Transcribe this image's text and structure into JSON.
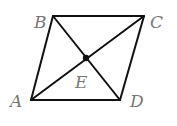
{
  "diagram": {
    "type": "parallelogram-with-diagonals",
    "colors": {
      "line": "#111111",
      "label": "#777777",
      "background": "#ffffff"
    },
    "vertices": [
      {
        "id": "A",
        "label": "A",
        "x": 31,
        "y": 100,
        "label_x": 10,
        "label_y": 107
      },
      {
        "id": "B",
        "label": "B",
        "x": 53,
        "y": 16,
        "label_x": 34,
        "label_y": 28
      },
      {
        "id": "C",
        "label": "C",
        "x": 144,
        "y": 16,
        "label_x": 150,
        "label_y": 28
      },
      {
        "id": "D",
        "label": "D",
        "x": 120,
        "y": 100,
        "label_x": 130,
        "label_y": 107
      }
    ],
    "intersection": {
      "id": "E",
      "label": "E",
      "x": 86,
      "y": 58,
      "label_x": 75,
      "label_y": 88
    },
    "edges": [
      [
        "A",
        "B"
      ],
      [
        "B",
        "C"
      ],
      [
        "C",
        "D"
      ],
      [
        "D",
        "A"
      ]
    ],
    "diagonals": [
      [
        "A",
        "C"
      ],
      [
        "B",
        "D"
      ]
    ]
  }
}
